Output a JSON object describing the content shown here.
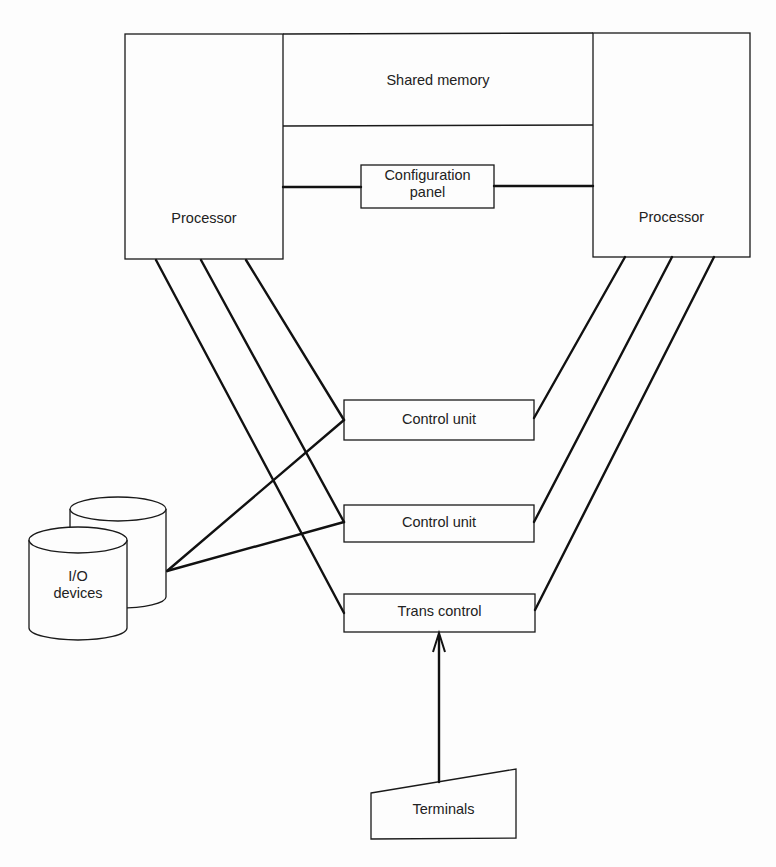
{
  "diagram": {
    "type": "system-architecture",
    "nodes": {
      "processor_left": {
        "label": "Processor"
      },
      "processor_right": {
        "label": "Processor"
      },
      "shared_memory": {
        "label": "Shared memory"
      },
      "config_panel": {
        "label_line1": "Configuration",
        "label_line2": "panel"
      },
      "control_unit_1": {
        "label": "Control unit"
      },
      "control_unit_2": {
        "label": "Control unit"
      },
      "trans_control": {
        "label": "Trans control"
      },
      "io_devices": {
        "label_line1": "I/O",
        "label_line2": "devices"
      },
      "terminals": {
        "label": "Terminals"
      }
    },
    "edges": [
      {
        "from": "processor_left",
        "to": "config_panel"
      },
      {
        "from": "config_panel",
        "to": "processor_right"
      },
      {
        "from": "processor_left",
        "to": "control_unit_1"
      },
      {
        "from": "processor_left",
        "to": "control_unit_2"
      },
      {
        "from": "processor_left",
        "to": "trans_control"
      },
      {
        "from": "processor_right",
        "to": "control_unit_1"
      },
      {
        "from": "processor_right",
        "to": "control_unit_2"
      },
      {
        "from": "processor_right",
        "to": "trans_control"
      },
      {
        "from": "io_devices",
        "to": "control_unit_1"
      },
      {
        "from": "io_devices",
        "to": "control_unit_2"
      },
      {
        "from": "terminals",
        "to": "trans_control",
        "arrow": true
      }
    ],
    "colors": {
      "stroke": "#1a1a1a",
      "background": "#fdfdfd"
    }
  }
}
